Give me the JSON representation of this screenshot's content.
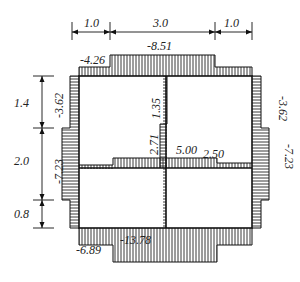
{
  "diagram": {
    "type": "frame-moment-diagram",
    "top_spans": [
      {
        "label": "1.0"
      },
      {
        "label": "3.0"
      },
      {
        "label": "1.0"
      }
    ],
    "left_heights": [
      {
        "label": "1.4"
      },
      {
        "label": "2.0"
      },
      {
        "label": "0.8"
      }
    ],
    "values": {
      "top_outer": "-4.26",
      "top_center": "-8.51",
      "left_upper": "-3.62",
      "left_lower": "-7.23",
      "right_upper": "-3.62",
      "right_lower": "-7.23",
      "column_upper": "1.35",
      "column_lower": "2.71",
      "beam_center": "5.00",
      "beam_right": "2.50",
      "bottom_outer": "-6.89",
      "bottom_center": "-13.78"
    },
    "colors": {
      "line": "#111111",
      "background": "#ffffff"
    }
  }
}
